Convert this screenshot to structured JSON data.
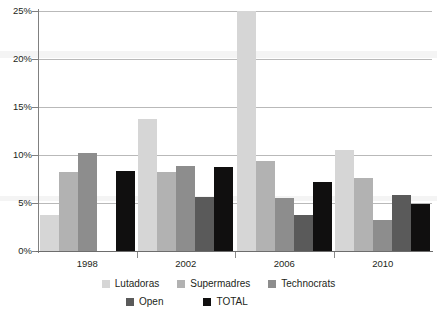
{
  "chart_data": {
    "type": "bar",
    "title": "",
    "subtitle": "",
    "xlabel": "",
    "ylabel": "",
    "categories": [
      "1998",
      "2002",
      "2006",
      "2010"
    ],
    "ylim": [
      0,
      25
    ],
    "ytick_values": [
      0,
      5,
      10,
      15,
      20,
      25
    ],
    "ytick_labels": [
      "0%",
      "5%",
      "10%",
      "15%",
      "20%",
      "25%"
    ],
    "grid": true,
    "grid_axis": "y",
    "legend_position": "bottom",
    "value_suffix": "%",
    "note": "2006 Lutadoras bar is clipped at the top of the 25% axis; 1998 Open has no bar.",
    "series": [
      {
        "name": "Lutadoras",
        "color": "#d6d6d6",
        "values": [
          3.8,
          13.8,
          25.0,
          10.5
        ]
      },
      {
        "name": "Supermadres",
        "color": "#b2b2b2",
        "values": [
          8.2,
          8.2,
          9.4,
          7.6
        ]
      },
      {
        "name": "Technocrats",
        "color": "#8d8d8d",
        "values": [
          10.2,
          8.9,
          5.5,
          3.2
        ]
      },
      {
        "name": "Open",
        "color": "#5a5a5a",
        "values": [
          null,
          5.6,
          3.7,
          5.8
        ]
      },
      {
        "name": "TOTAL",
        "color": "#100f0f",
        "values": [
          8.3,
          8.8,
          7.2,
          4.9
        ]
      }
    ]
  },
  "axis": {
    "y_ticks": [
      {
        "label": "25%",
        "value": 25
      },
      {
        "label": "20%",
        "value": 20
      },
      {
        "label": "15%",
        "value": 15
      },
      {
        "label": "10%",
        "value": 10
      },
      {
        "label": "5%",
        "value": 5
      },
      {
        "label": "0%",
        "value": 0
      }
    ],
    "x_ticks": [
      {
        "label": "1998"
      },
      {
        "label": "2002"
      },
      {
        "label": "2006"
      },
      {
        "label": "2010"
      }
    ]
  },
  "legend": {
    "rows": [
      [
        {
          "label": "Lutadoras",
          "color": "#d6d6d6"
        },
        {
          "label": "Supermadres",
          "color": "#b2b2b2"
        },
        {
          "label": "Technocrats",
          "color": "#8d8d8d"
        }
      ],
      [
        {
          "label": "Open",
          "color": "#5a5a5a"
        },
        {
          "label": "TOTAL",
          "color": "#100f0f"
        }
      ]
    ]
  }
}
